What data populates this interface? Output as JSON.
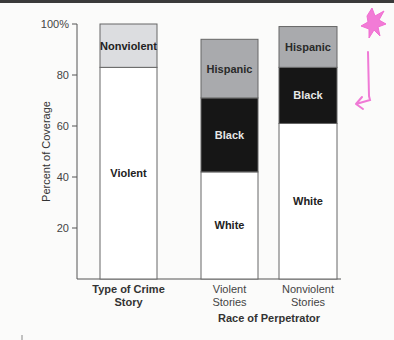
{
  "chart_data": {
    "type": "bar",
    "stacked": true,
    "title": "",
    "xlabel": "",
    "ylabel": "Percent of Coverage",
    "ylim": [
      0,
      100
    ],
    "yticks": [
      {
        "value": 20,
        "label": "20"
      },
      {
        "value": 40,
        "label": "40"
      },
      {
        "value": 60,
        "label": "60"
      },
      {
        "value": 80,
        "label": "80"
      },
      {
        "value": 100,
        "label": "100%"
      }
    ],
    "grid": false,
    "legend": "none (segments labeled inline)",
    "groups": [
      {
        "label": "Type of Crime Story",
        "label_lines": [
          "Type of Crime",
          "Story"
        ],
        "bold": true
      },
      {
        "label": "Race of Perpetrator",
        "label_lines": [
          "Race of Perpetrator"
        ],
        "bold": true
      }
    ],
    "bars": [
      {
        "category": "Type of Crime Story",
        "category_lines": [],
        "group": 0,
        "segments": [
          {
            "name": "Violent",
            "value": 83,
            "color": "#ffffff",
            "text_color": "#222222"
          },
          {
            "name": "Nonviolent",
            "value": 17,
            "color": "#dcdde0",
            "text_color": "#222222"
          }
        ]
      },
      {
        "category": "Violent Stories",
        "category_lines": [
          "Violent",
          "Stories"
        ],
        "group": 1,
        "segments": [
          {
            "name": "White",
            "value": 42,
            "color": "#ffffff",
            "text_color": "#222222"
          },
          {
            "name": "Black",
            "value": 29,
            "color": "#161616",
            "text_color": "#e6e6e6"
          },
          {
            "name": "Hispanic",
            "value": 23,
            "color": "#a9aaad",
            "text_color": "#2a2a2a"
          }
        ]
      },
      {
        "category": "Nonviolent Stories",
        "category_lines": [
          "Nonviolent",
          "Stories"
        ],
        "group": 1,
        "segments": [
          {
            "name": "White",
            "value": 61,
            "color": "#ffffff",
            "text_color": "#222222"
          },
          {
            "name": "Black",
            "value": 22,
            "color": "#161616",
            "text_color": "#e6e6e6"
          },
          {
            "name": "Hispanic",
            "value": 16,
            "color": "#a9aaad",
            "text_color": "#2a2a2a"
          }
        ]
      }
    ],
    "annotations": [
      {
        "type": "hand-drawn doodle",
        "description": "pink star and hooked arrow pointing left toward Black segment",
        "color": "#f06ed2"
      }
    ]
  }
}
